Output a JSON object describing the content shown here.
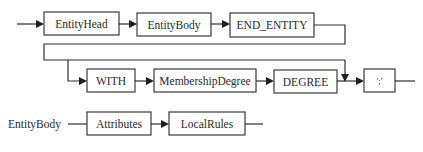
{
  "diagram": {
    "type": "syntax-railroad",
    "row1": {
      "nodes": [
        {
          "label": "EntityHead"
        },
        {
          "label": "EntityBody"
        },
        {
          "label": "END_ENTITY"
        }
      ]
    },
    "row2": {
      "nodes": [
        {
          "label": "WITH"
        },
        {
          "label": "MembershipDegree"
        },
        {
          "label": "DEGREE"
        },
        {
          "label": "';'"
        }
      ],
      "bypass": "optional WITH MembershipDegree DEGREE clause"
    },
    "row3": {
      "rule_name": "EntityBody",
      "nodes": [
        {
          "label": "Attributes"
        },
        {
          "label": "LocalRules"
        }
      ]
    },
    "colors": {
      "stroke": "#2e2e2e",
      "text": "#2a2a2a",
      "background": "#ffffff"
    }
  }
}
